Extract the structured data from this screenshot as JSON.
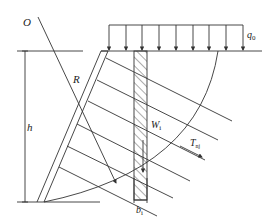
{
  "diagram": {
    "type": "slope-stability-anchored-wall",
    "labels": {
      "center": "O",
      "radius": "R",
      "height": "h",
      "load": {
        "main": "q",
        "sub": "0"
      },
      "slice_weight": {
        "main": "W",
        "sub": "i"
      },
      "anchor_force": {
        "main": "T",
        "sub": "nj"
      },
      "slice_width": {
        "main": "b",
        "sub": "i"
      }
    },
    "colors": {
      "line": "#333333",
      "background": "#ffffff"
    },
    "load_arrow_count": 9,
    "anchor_count": 6
  }
}
